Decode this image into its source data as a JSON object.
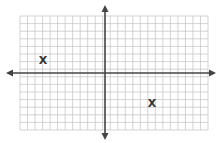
{
  "diagram": {
    "type": "coordinate-grid",
    "grid": {
      "cols": 25,
      "rows": 15,
      "color": "#c8c8c8"
    },
    "axis_color": "#444444",
    "origin_col": 11.3,
    "origin_row": 7.6
  },
  "points": [
    {
      "label": "X",
      "x": -8,
      "y": 2
    },
    {
      "label": "X",
      "x": 6,
      "y": -4
    }
  ]
}
